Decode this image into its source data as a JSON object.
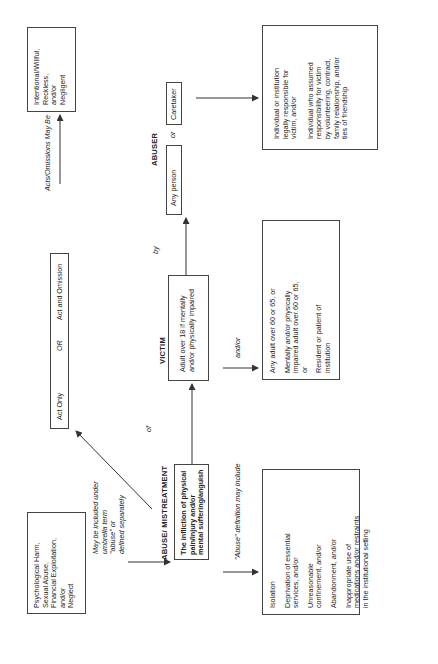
{
  "diagram": {
    "orientation": "rotated 90 degrees counter-clockwise",
    "nodes": {
      "related_harms": {
        "lines": [
          "Psychological Harm,",
          "Sexual Abuse,",
          "Financial Exploitation,",
          "and/or",
          "Neglect"
        ]
      },
      "related_harms_note": {
        "lines": [
          "May be included under",
          "umbrella term",
          "\"abuse\" or",
          "defined separately"
        ]
      },
      "abuse_heading": "ABUSE/ MISTREATMENT",
      "abuse_definition": {
        "lines": [
          "The infliction of physical",
          "pain/injury and/or",
          "mental suffering/anguish"
        ]
      },
      "abuse_include_label": "\"Abuse\" definition may include",
      "abuse_includes": [
        {
          "lines": [
            "Isolation"
          ]
        },
        {
          "lines": [
            "Deprivation of essential",
            "services, and/or"
          ]
        },
        {
          "lines": [
            "Unreasonable",
            "confinement, and/or"
          ]
        },
        {
          "lines": [
            "Abandonment, and/or"
          ]
        },
        {
          "lines": [
            "Inappropriate use of",
            "medications and/or restraints",
            "in the institutional setting"
          ]
        }
      ],
      "act_type": {
        "left": "Act Only",
        "middle": "OR",
        "right": "Act and Omission"
      },
      "acts_label": "Acts/Omissions May Be",
      "intent": {
        "lines": [
          "Intentional/Willful,",
          "Reckless,",
          "and/or",
          "Negligent"
        ]
      },
      "of_label": "of",
      "victim_heading": "VICTIM",
      "victim_definition": {
        "lines": [
          "Adult over 18 if mentally",
          "and/or physically impaired"
        ]
      },
      "victim_andor_label": "and/or",
      "victim_details": [
        {
          "lines": [
            "Any adult over 60 or 65,  or"
          ]
        },
        {
          "lines": [
            "Mentally and/or physically",
            "impaired adult over 60 or 65,",
            "or"
          ]
        },
        {
          "lines": [
            "Resident or patient of",
            "institution"
          ]
        }
      ],
      "by_label": "by",
      "abuser_heading": "ABUSER",
      "abuser_any": "Any person",
      "abuser_or": "or",
      "abuser_caretaker": "Caretaker",
      "abuser_details": [
        {
          "lines": [
            "Individual or institution",
            "legally responsible for",
            "victim, and/or"
          ]
        },
        {
          "lines": [
            "Individual who assumed",
            "responsibility for victim",
            "by volunteering, contract,",
            "family relationship, and/or",
            "ties of friendship"
          ]
        }
      ]
    },
    "colors": {
      "line": "#333333",
      "background": "#ffffff",
      "text": "#222222"
    }
  }
}
